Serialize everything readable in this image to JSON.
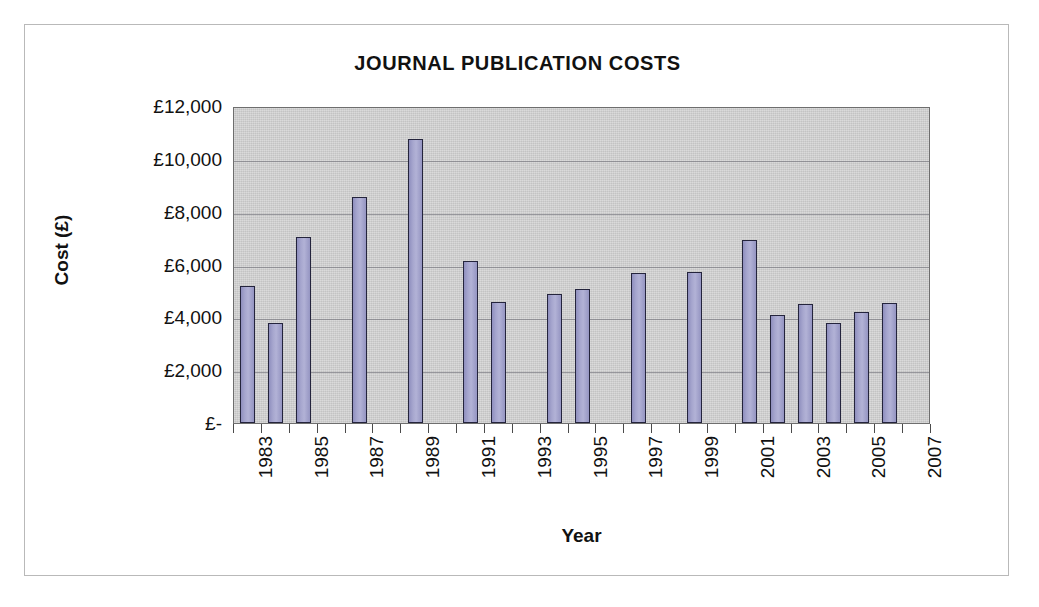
{
  "frame": {
    "background_color": "#ffffff",
    "border_color": "#b9b9b9"
  },
  "chart_data": {
    "type": "bar",
    "title": "JOURNAL PUBLICATION COSTS",
    "xlabel": "Year",
    "ylabel": "Cost (£)",
    "ylim": [
      0,
      12000
    ],
    "ytick_values": [
      12000,
      10000,
      8000,
      6000,
      4000,
      2000,
      0
    ],
    "ytick_labels": [
      "£12,000",
      "£10,000",
      "£8,000",
      "£6,000",
      "£4,000",
      "£2,000",
      "£-"
    ],
    "xtick_labels": [
      "1983",
      "1985",
      "1987",
      "1989",
      "1991",
      "1993",
      "1995",
      "1997",
      "1999",
      "2001",
      "2003",
      "2005",
      "2007"
    ],
    "x_axis_min_year": 1983,
    "x_axis_max_year": 2008,
    "grid": true,
    "legend": "none",
    "plot_background_color": "#cbcbcb",
    "bar_fill_color": "#9a9ac4",
    "bar_border_color": "#24243c",
    "categories": [
      1983,
      1984,
      1985,
      1986,
      1987,
      1988,
      1989,
      1990,
      1991,
      1992,
      1993,
      1994,
      1995,
      1996,
      1997,
      1998,
      1999,
      2000,
      2001,
      2002,
      2003,
      2004,
      2005,
      2006,
      2007
    ],
    "values": [
      5180,
      3790,
      7050,
      null,
      8570,
      null,
      10760,
      null,
      6130,
      4590,
      null,
      4880,
      5080,
      null,
      5660,
      null,
      5730,
      null,
      6930,
      4080,
      4490,
      3770,
      4200,
      4550,
      null
    ],
    "points": [
      {
        "year": "1983",
        "value": 5180
      },
      {
        "year": "1984",
        "value": 3790
      },
      {
        "year": "1985",
        "value": 7050
      },
      {
        "year": "1987",
        "value": 8570
      },
      {
        "year": "1989",
        "value": 10760
      },
      {
        "year": "1991",
        "value": 6130
      },
      {
        "year": "1992",
        "value": 4590
      },
      {
        "year": "1994",
        "value": 4880
      },
      {
        "year": "1995",
        "value": 5080
      },
      {
        "year": "1997",
        "value": 5660
      },
      {
        "year": "1999",
        "value": 5730
      },
      {
        "year": "2001",
        "value": 6930
      },
      {
        "year": "2002",
        "value": 4080
      },
      {
        "year": "2003",
        "value": 4490
      },
      {
        "year": "2004",
        "value": 3770
      },
      {
        "year": "2005",
        "value": 4200
      },
      {
        "year": "2006",
        "value": 4550
      }
    ]
  }
}
